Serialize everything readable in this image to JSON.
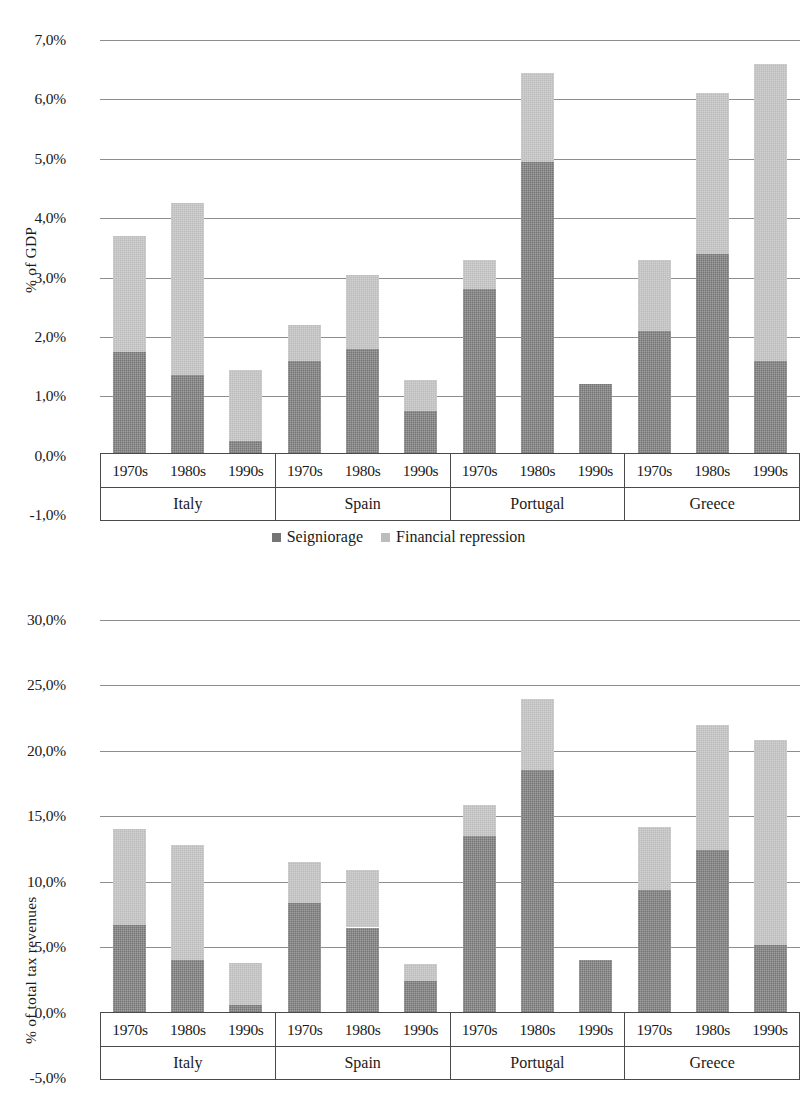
{
  "legend": {
    "items": [
      {
        "label": "Seigniorage",
        "color": "#757575",
        "key": "seigniorage"
      },
      {
        "label": "Financial repression",
        "color": "#bcbcbc",
        "key": "financial_repression"
      }
    ]
  },
  "axis_table": {
    "decades": [
      "1970s",
      "1980s",
      "1990s"
    ],
    "countries": [
      "Italy",
      "Spain",
      "Portugal",
      "Greece"
    ]
  },
  "chart_data": [
    {
      "id": "gdp",
      "type": "bar",
      "stacked": true,
      "title": "",
      "xlabel": "",
      "ylabel": "% of GDP",
      "ylim": [
        -1.0,
        7.0
      ],
      "yticks": [
        -1.0,
        0.0,
        1.0,
        2.0,
        3.0,
        4.0,
        5.0,
        6.0,
        7.0
      ],
      "ytick_labels": [
        "-1,0%",
        "0,0%",
        "1,0%",
        "2,0%",
        "3,0%",
        "4,0%",
        "5,0%",
        "6,0%",
        "7,0%"
      ],
      "grid": true,
      "legend_position": "bottom",
      "categories": [
        "Italy 1970s",
        "Italy 1980s",
        "Italy 1990s",
        "Spain 1970s",
        "Spain 1980s",
        "Spain 1990s",
        "Portugal 1970s",
        "Portugal 1980s",
        "Portugal 1990s",
        "Greece 1970s",
        "Greece 1980s",
        "Greece 1990s"
      ],
      "series": [
        {
          "name": "Seigniorage",
          "color": "#757575",
          "values": [
            1.75,
            1.35,
            0.25,
            1.6,
            1.8,
            0.75,
            2.8,
            4.95,
            1.2,
            2.1,
            3.4,
            1.6
          ]
        },
        {
          "name": "Financial repression",
          "color": "#bcbcbc",
          "values": [
            1.95,
            2.9,
            1.2,
            0.6,
            1.25,
            0.52,
            0.5,
            1.5,
            -0.2,
            1.2,
            2.7,
            5.0
          ]
        }
      ],
      "totals": [
        3.7,
        4.25,
        1.45,
        2.2,
        3.05,
        1.27,
        3.3,
        6.45,
        1.2,
        3.3,
        6.1,
        6.6
      ]
    },
    {
      "id": "tax_revenues",
      "type": "bar",
      "stacked": true,
      "title": "",
      "xlabel": "",
      "ylabel": "% of total tax revenues",
      "ylim": [
        -5.0,
        30.0
      ],
      "yticks": [
        -5.0,
        0.0,
        5.0,
        10.0,
        15.0,
        20.0,
        25.0,
        30.0
      ],
      "ytick_labels": [
        "-5,0%",
        "0,0%",
        "5,0%",
        "10,0%",
        "15,0%",
        "20,0%",
        "25,0%",
        "30,0%"
      ],
      "grid": true,
      "legend_position": "none",
      "categories": [
        "Italy 1970s",
        "Italy 1980s",
        "Italy 1990s",
        "Spain 1970s",
        "Spain 1980s",
        "Spain 1990s",
        "Portugal 1970s",
        "Portugal 1980s",
        "Portugal 1990s",
        "Greece 1970s",
        "Greece 1980s",
        "Greece 1990s"
      ],
      "series": [
        {
          "name": "Seigniorage",
          "color": "#757575",
          "values": [
            6.7,
            4.0,
            0.6,
            8.4,
            6.5,
            2.4,
            13.5,
            18.5,
            4.0,
            9.4,
            12.4,
            5.2
          ]
        },
        {
          "name": "Financial repression",
          "color": "#bcbcbc",
          "values": [
            7.3,
            8.8,
            3.2,
            3.1,
            4.4,
            1.3,
            2.4,
            5.5,
            -0.55,
            4.8,
            9.6,
            15.6
          ]
        }
      ],
      "totals": [
        14.0,
        12.8,
        3.8,
        11.5,
        10.9,
        3.7,
        15.9,
        24.0,
        4.0,
        14.2,
        22.0,
        20.8
      ]
    }
  ]
}
